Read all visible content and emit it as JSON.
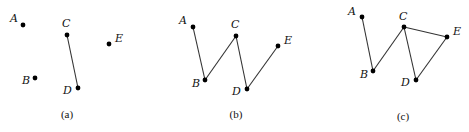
{
  "figure": {
    "panels": [
      {
        "caption": "(a)",
        "caption_pos": [
          67,
          118
        ],
        "vertices": [
          {
            "id": "A",
            "label": "A",
            "x": 23,
            "y": 25,
            "lx": 10,
            "ly": 22
          },
          {
            "id": "B",
            "label": "B",
            "x": 35,
            "y": 78,
            "lx": 22,
            "ly": 84
          },
          {
            "id": "C",
            "label": "C",
            "x": 67,
            "y": 35,
            "lx": 62,
            "ly": 27
          },
          {
            "id": "D",
            "label": "D",
            "x": 78,
            "y": 88,
            "lx": 63,
            "ly": 94
          },
          {
            "id": "E",
            "label": "E",
            "x": 109,
            "y": 44,
            "lx": 115,
            "ly": 42
          }
        ],
        "edges": [
          [
            "C",
            "D"
          ]
        ]
      },
      {
        "caption": "(b)",
        "caption_pos": [
          236,
          118
        ],
        "vertices": [
          {
            "id": "A",
            "label": "A",
            "x": 193,
            "y": 27,
            "lx": 179,
            "ly": 24
          },
          {
            "id": "B",
            "label": "B",
            "x": 205,
            "y": 80,
            "lx": 192,
            "ly": 87
          },
          {
            "id": "C",
            "label": "C",
            "x": 236,
            "y": 36,
            "lx": 231,
            "ly": 28
          },
          {
            "id": "D",
            "label": "D",
            "x": 247,
            "y": 89,
            "lx": 232,
            "ly": 95
          },
          {
            "id": "E",
            "label": "E",
            "x": 278,
            "y": 46,
            "lx": 284,
            "ly": 44
          }
        ],
        "edges": [
          [
            "A",
            "B"
          ],
          [
            "B",
            "C"
          ],
          [
            "C",
            "D"
          ],
          [
            "D",
            "E"
          ]
        ]
      },
      {
        "caption": "(c)",
        "caption_pos": [
          403,
          120
        ],
        "vertices": [
          {
            "id": "A",
            "label": "A",
            "x": 362,
            "y": 17,
            "lx": 348,
            "ly": 15
          },
          {
            "id": "B",
            "label": "B",
            "x": 373,
            "y": 71,
            "lx": 360,
            "ly": 78
          },
          {
            "id": "C",
            "label": "C",
            "x": 404,
            "y": 27,
            "lx": 399,
            "ly": 20
          },
          {
            "id": "D",
            "label": "D",
            "x": 416,
            "y": 80,
            "lx": 401,
            "ly": 86
          },
          {
            "id": "E",
            "label": "E",
            "x": 447,
            "y": 37,
            "lx": 453,
            "ly": 35
          }
        ],
        "edges": [
          [
            "A",
            "B"
          ],
          [
            "B",
            "C"
          ],
          [
            "C",
            "D"
          ],
          [
            "D",
            "E"
          ],
          [
            "C",
            "E"
          ]
        ]
      }
    ]
  }
}
